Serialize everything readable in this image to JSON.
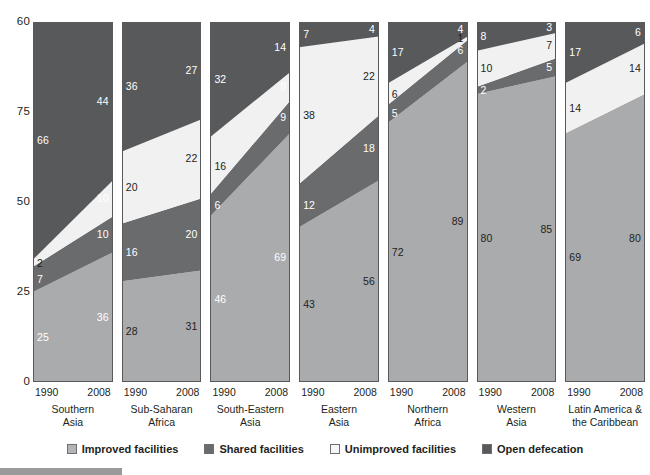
{
  "chart_data": {
    "type": "area",
    "title": "",
    "subtitle": "",
    "xlabel": "",
    "ylabel": "",
    "x": [
      "1990",
      "2008"
    ],
    "ylim": [
      0,
      100
    ],
    "yticks": [
      "60",
      "75",
      "50",
      "25",
      "0"
    ],
    "ytick_values": [
      100,
      75,
      50,
      25,
      0
    ],
    "grid": false,
    "legend_position": "bottom",
    "stacked": true,
    "series": [
      {
        "name": "Improved facilities",
        "color": "#aaabad",
        "swatch": "#b3b4b6"
      },
      {
        "name": "Shared facilities",
        "color": "#6a6b6d",
        "swatch": "#6a6b6d"
      },
      {
        "name": "Unimproved facilities",
        "color": "#f1f1f1",
        "swatch": "#f7f7f7"
      },
      {
        "name": "Open defecation",
        "color": "#58595b",
        "swatch": "#58595b"
      }
    ],
    "panels": [
      {
        "region": [
          "Southern",
          "Asia"
        ],
        "values": {
          "Improved facilities": [
            25,
            36
          ],
          "Shared facilities": [
            7,
            10
          ],
          "Unimproved facilities": [
            2,
            10
          ],
          "Open defecation": [
            66,
            44
          ]
        },
        "labels": [
          {
            "text": "25",
            "side": "left",
            "series": "Improved facilities",
            "tone": "light"
          },
          {
            "text": "7",
            "side": "left",
            "series": "Shared facilities",
            "tone": "light"
          },
          {
            "text": "2",
            "side": "left",
            "series": "Unimproved facilities",
            "tone": "dark"
          },
          {
            "text": "66",
            "side": "left",
            "series": "Open defecation",
            "tone": "light"
          },
          {
            "text": "36",
            "side": "right",
            "series": "Improved facilities",
            "tone": "light"
          },
          {
            "text": "10",
            "side": "right",
            "series": "Shared facilities",
            "tone": "light"
          },
          {
            "text": "10",
            "side": "right",
            "series": "Unimproved facilities",
            "tone": "light"
          },
          {
            "text": "44",
            "side": "right",
            "series": "Open defecation",
            "tone": "light"
          }
        ]
      },
      {
        "region": [
          "Sub-Saharan",
          "Africa"
        ],
        "values": {
          "Improved facilities": [
            28,
            31
          ],
          "Shared facilities": [
            16,
            20
          ],
          "Unimproved facilities": [
            20,
            22
          ],
          "Open defecation": [
            36,
            27
          ]
        },
        "labels": [
          {
            "text": "28",
            "side": "left",
            "series": "Improved facilities",
            "tone": "dark"
          },
          {
            "text": "16",
            "side": "left",
            "series": "Shared facilities",
            "tone": "light"
          },
          {
            "text": "20",
            "side": "left",
            "series": "Unimproved facilities",
            "tone": "dark"
          },
          {
            "text": "36",
            "side": "left",
            "series": "Open defecation",
            "tone": "light"
          },
          {
            "text": "31",
            "side": "right",
            "series": "Improved facilities",
            "tone": "dark"
          },
          {
            "text": "20",
            "side": "right",
            "series": "Shared facilities",
            "tone": "light"
          },
          {
            "text": "22",
            "side": "right",
            "series": "Unimproved facilities",
            "tone": "dark"
          },
          {
            "text": "27",
            "side": "right",
            "series": "Open defecation",
            "tone": "light"
          }
        ]
      },
      {
        "region": [
          "South-Eastern",
          "Asia"
        ],
        "values": {
          "Improved facilities": [
            46,
            69
          ],
          "Shared facilities": [
            6,
            9
          ],
          "Unimproved facilities": [
            16,
            8
          ],
          "Open defecation": [
            32,
            14
          ]
        },
        "labels": [
          {
            "text": "46",
            "side": "left",
            "series": "Improved facilities",
            "tone": "light"
          },
          {
            "text": "6",
            "side": "left",
            "series": "Shared facilities",
            "tone": "light"
          },
          {
            "text": "16",
            "side": "left",
            "series": "Unimproved facilities",
            "tone": "dark"
          },
          {
            "text": "32",
            "side": "left",
            "series": "Open defecation",
            "tone": "light"
          },
          {
            "text": "69",
            "side": "right",
            "series": "Improved facilities",
            "tone": "light"
          },
          {
            "text": "9",
            "side": "right",
            "series": "Shared facilities",
            "tone": "light"
          },
          {
            "text": "8",
            "side": "right",
            "series": "Unimproved facilities",
            "tone": "light"
          },
          {
            "text": "14",
            "side": "right",
            "series": "Open defecation",
            "tone": "light"
          }
        ]
      },
      {
        "region": [
          "Eastern",
          "Asia"
        ],
        "values": {
          "Improved facilities": [
            43,
            56
          ],
          "Shared facilities": [
            12,
            18
          ],
          "Unimproved facilities": [
            38,
            22
          ],
          "Open defecation": [
            7,
            4
          ]
        },
        "labels": [
          {
            "text": "43",
            "side": "left",
            "series": "Improved facilities",
            "tone": "dark"
          },
          {
            "text": "12",
            "side": "left",
            "series": "Shared facilities",
            "tone": "light"
          },
          {
            "text": "38",
            "side": "left",
            "series": "Unimproved facilities",
            "tone": "dark"
          },
          {
            "text": "7",
            "side": "left",
            "series": "Open defecation",
            "tone": "light"
          },
          {
            "text": "56",
            "side": "right",
            "series": "Improved facilities",
            "tone": "dark"
          },
          {
            "text": "18",
            "side": "right",
            "series": "Shared facilities",
            "tone": "light"
          },
          {
            "text": "22",
            "side": "right",
            "series": "Unimproved facilities",
            "tone": "dark"
          },
          {
            "text": "4",
            "side": "right",
            "series": "Open defecation",
            "tone": "light"
          }
        ]
      },
      {
        "region": [
          "Northern",
          "Africa"
        ],
        "values": {
          "Improved facilities": [
            72,
            89
          ],
          "Shared facilities": [
            5,
            6
          ],
          "Unimproved facilities": [
            6,
            1
          ],
          "Open defecation": [
            17,
            4
          ]
        },
        "labels": [
          {
            "text": "72",
            "side": "left",
            "series": "Improved facilities",
            "tone": "dark"
          },
          {
            "text": "5",
            "side": "left",
            "series": "Shared facilities",
            "tone": "light"
          },
          {
            "text": "6",
            "side": "left",
            "series": "Unimproved facilities",
            "tone": "dark"
          },
          {
            "text": "17",
            "side": "left",
            "series": "Open defecation",
            "tone": "light"
          },
          {
            "text": "89",
            "side": "right",
            "series": "Improved facilities",
            "tone": "dark"
          },
          {
            "text": "6",
            "side": "right",
            "series": "Shared facilities",
            "tone": "light"
          },
          {
            "text": "1",
            "side": "right",
            "series": "Unimproved facilities",
            "tone": "dark"
          },
          {
            "text": "4",
            "side": "right",
            "series": "Open defecation",
            "tone": "light"
          }
        ]
      },
      {
        "region": [
          "Western",
          "Asia"
        ],
        "values": {
          "Improved facilities": [
            80,
            85
          ],
          "Shared facilities": [
            2,
            5
          ],
          "Unimproved facilities": [
            10,
            7
          ],
          "Open defecation": [
            8,
            3
          ]
        },
        "labels": [
          {
            "text": "80",
            "side": "left",
            "series": "Improved facilities",
            "tone": "dark"
          },
          {
            "text": "2",
            "side": "left",
            "series": "Shared facilities",
            "tone": "light"
          },
          {
            "text": "10",
            "side": "left",
            "series": "Unimproved facilities",
            "tone": "dark"
          },
          {
            "text": "8",
            "side": "left",
            "series": "Open defecation",
            "tone": "light"
          },
          {
            "text": "85",
            "side": "right",
            "series": "Improved facilities",
            "tone": "dark"
          },
          {
            "text": "5",
            "side": "right",
            "series": "Shared facilities",
            "tone": "light"
          },
          {
            "text": "7",
            "side": "right",
            "series": "Unimproved facilities",
            "tone": "dark"
          },
          {
            "text": "3",
            "side": "right",
            "series": "Open defecation",
            "tone": "light"
          }
        ]
      },
      {
        "region": [
          "Latin America &",
          "the Caribbean"
        ],
        "values": {
          "Improved facilities": [
            69,
            80
          ],
          "Shared facilities": [
            0,
            0
          ],
          "Unimproved facilities": [
            14,
            14
          ],
          "Open defecation": [
            17,
            6
          ]
        },
        "labels": [
          {
            "text": "69",
            "side": "left",
            "series": "Improved facilities",
            "tone": "dark"
          },
          {
            "text": "14",
            "side": "left",
            "series": "Unimproved facilities",
            "tone": "dark"
          },
          {
            "text": "17",
            "side": "left",
            "series": "Open defecation",
            "tone": "light"
          },
          {
            "text": "80",
            "side": "right",
            "series": "Improved facilities",
            "tone": "dark"
          },
          {
            "text": "14",
            "side": "right",
            "series": "Unimproved facilities",
            "tone": "dark"
          },
          {
            "text": "6",
            "side": "right",
            "series": "Open defecation",
            "tone": "light"
          }
        ]
      }
    ]
  },
  "axis": {
    "years": {
      "left": "1990",
      "right": "2008"
    }
  },
  "legend": {
    "items": [
      {
        "label": "Improved facilities"
      },
      {
        "label": "Shared facilities"
      },
      {
        "label": "Unimproved facilities"
      },
      {
        "label": "Open defecation"
      }
    ]
  }
}
